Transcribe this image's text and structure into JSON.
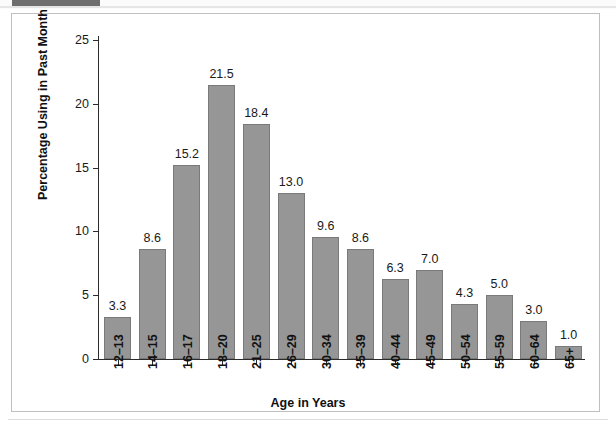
{
  "chart_data": {
    "type": "bar",
    "title": "",
    "xlabel": "Age in Years",
    "ylabel": "Percentage Using in Past Month",
    "categories": [
      "12–13",
      "14–15",
      "16–17",
      "18–20",
      "21–25",
      "26–29",
      "30–34",
      "35–39",
      "40–44",
      "45–49",
      "50–54",
      "55–59",
      "60–64",
      "65+"
    ],
    "values": [
      3.3,
      8.6,
      15.2,
      21.5,
      18.4,
      13.0,
      9.6,
      8.6,
      6.3,
      7.0,
      4.3,
      5.0,
      3.0,
      1.0
    ],
    "value_labels": [
      "3.3",
      "8.6",
      "15.2",
      "21.5",
      "18.4",
      "13.0",
      "9.6",
      "8.6",
      "6.3",
      "7.0",
      "4.3",
      "5.0",
      "3.0",
      "1.0"
    ],
    "ylim": [
      0,
      25
    ],
    "yticks": [
      0,
      5,
      10,
      15,
      20,
      25
    ],
    "ytick_labels": [
      "0",
      "5",
      "10",
      "15",
      "20",
      "25"
    ],
    "grid": false,
    "legend": null,
    "bar_color": "#969696",
    "bar_edge_color": "#7a7a7a",
    "axis_color": "#2b2b2b",
    "frame_color": "#bfbfbf"
  }
}
